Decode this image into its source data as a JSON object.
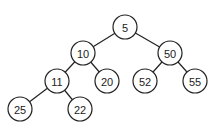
{
  "diagram": {
    "type": "binary-tree",
    "nodes": [
      {
        "id": "n5",
        "label": "5",
        "x": 125,
        "y": 27
      },
      {
        "id": "n10",
        "label": "10",
        "x": 83,
        "y": 53
      },
      {
        "id": "n50",
        "label": "50",
        "x": 170,
        "y": 53
      },
      {
        "id": "n11",
        "label": "11",
        "x": 57,
        "y": 81
      },
      {
        "id": "n20",
        "label": "20",
        "x": 107,
        "y": 81
      },
      {
        "id": "n52",
        "label": "52",
        "x": 145,
        "y": 81
      },
      {
        "id": "n55",
        "label": "55",
        "x": 195,
        "y": 81
      },
      {
        "id": "n25",
        "label": "25",
        "x": 20,
        "y": 109
      },
      {
        "id": "n22",
        "label": "22",
        "x": 80,
        "y": 109
      }
    ],
    "edges": [
      [
        "n5",
        "n10"
      ],
      [
        "n5",
        "n50"
      ],
      [
        "n10",
        "n11"
      ],
      [
        "n10",
        "n20"
      ],
      [
        "n50",
        "n52"
      ],
      [
        "n50",
        "n55"
      ],
      [
        "n11",
        "n25"
      ],
      [
        "n11",
        "n22"
      ]
    ],
    "radius": 12
  }
}
